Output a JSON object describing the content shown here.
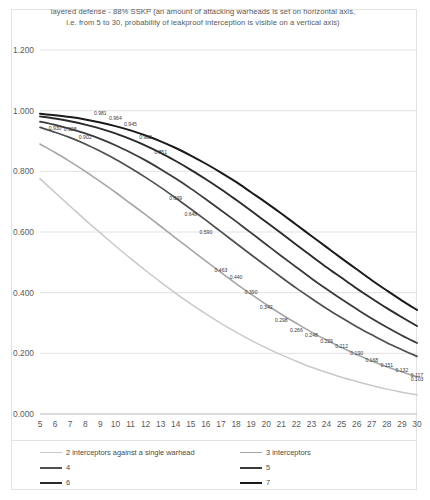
{
  "chart_data": {
    "type": "line",
    "title": "layered defense - 88% SSKP (an amount of attacking warheads is set on horizontal axis, i.e. from 5 to 30, probability of leakproof interception is visible on a vertical axis)",
    "title_line1": "layered defense - 88% SSKP (an amount of attacking warheads is set on horizontal axis,",
    "title_line2": "i.e. from 5 to 30, probability of leakproof interception is visible on a vertical axis)",
    "xlabel": "",
    "ylabel": "",
    "xlim": [
      5,
      30
    ],
    "ylim": [
      0.0,
      1.2
    ],
    "grid": true,
    "legend_position": "bottom",
    "ytick_labels": [
      "1.200",
      "1.000",
      "0.800",
      "0.600",
      "0.400",
      "0.200",
      "0.000"
    ],
    "ytick_values": [
      1.2,
      1.0,
      0.8,
      0.6,
      0.4,
      0.2,
      0.0
    ],
    "x": [
      5,
      6,
      7,
      8,
      9,
      10,
      11,
      12,
      13,
      14,
      15,
      16,
      17,
      18,
      19,
      20,
      21,
      22,
      23,
      24,
      25,
      26,
      27,
      28,
      29,
      30
    ],
    "xtick_labels": [
      "5",
      "6",
      "7",
      "8",
      "9",
      "10",
      "11",
      "12",
      "13",
      "14",
      "15",
      "16",
      "17",
      "18",
      "19",
      "20",
      "21",
      "22",
      "23",
      "24",
      "25",
      "26",
      "27",
      "28",
      "29",
      "30"
    ],
    "series": [
      {
        "name": "2 interceptors against a single warhead",
        "legend_label": "2 interceptors against a single warhead",
        "color": "#c9c9c9",
        "width": 1.5,
        "values": [
          0.776,
          0.73,
          0.685,
          0.64,
          0.597,
          0.554,
          0.513,
          0.473,
          0.435,
          0.398,
          0.363,
          0.33,
          0.299,
          0.27,
          0.243,
          0.218,
          0.195,
          0.174,
          0.154,
          0.137,
          0.121,
          0.107,
          0.094,
          0.082,
          0.072,
          0.063
        ],
        "labels": []
      },
      {
        "name": "3 interceptors",
        "legend_label": "3 interceptors",
        "color": "#a6a6a6",
        "width": 1.6,
        "values": [
          0.89,
          0.862,
          0.832,
          0.8,
          0.766,
          0.731,
          0.694,
          0.657,
          0.619,
          0.58,
          0.542,
          0.504,
          0.467,
          0.43,
          0.395,
          0.361,
          0.329,
          0.299,
          0.27,
          0.244,
          0.219,
          0.196,
          0.175,
          0.156,
          0.139,
          0.123
        ],
        "labels": []
      },
      {
        "name": "4",
        "legend_label": "4",
        "color": "#4f4f4f",
        "width": 1.7,
        "values": [
          0.945,
          0.929,
          0.911,
          0.89,
          0.866,
          0.84,
          0.811,
          0.78,
          0.747,
          0.712,
          0.676,
          0.639,
          0.601,
          0.563,
          0.525,
          0.488,
          0.451,
          0.415,
          0.381,
          0.348,
          0.317,
          0.288,
          0.261,
          0.235,
          0.212,
          0.19
        ],
        "labels": []
      },
      {
        "name": "5",
        "legend_label": "5",
        "color": "#3a3a3a",
        "width": 1.8,
        "values": [
          0.964,
          0.953,
          0.94,
          0.925,
          0.907,
          0.886,
          0.862,
          0.836,
          0.807,
          0.776,
          0.743,
          0.708,
          0.672,
          0.635,
          0.597,
          0.559,
          0.521,
          0.484,
          0.447,
          0.412,
          0.378,
          0.346,
          0.315,
          0.286,
          0.259,
          0.234
        ]
      },
      {
        "name": "6",
        "legend_label": "6",
        "color": "#2b2b2b",
        "width": 1.9,
        "values": [
          0.981,
          0.974,
          0.965,
          0.954,
          0.941,
          0.925,
          0.906,
          0.885,
          0.861,
          0.834,
          0.805,
          0.774,
          0.741,
          0.706,
          0.67,
          0.633,
          0.596,
          0.558,
          0.521,
          0.484,
          0.449,
          0.414,
          0.381,
          0.349,
          0.319,
          0.29
        ]
      },
      {
        "name": "7",
        "legend_label": "7",
        "color": "#1a1a1a",
        "width": 2.0,
        "values": [
          0.99,
          0.985,
          0.979,
          0.971,
          0.961,
          0.949,
          0.935,
          0.918,
          0.899,
          0.877,
          0.852,
          0.825,
          0.796,
          0.765,
          0.731,
          0.697,
          0.661,
          0.624,
          0.587,
          0.55,
          0.513,
          0.477,
          0.441,
          0.407,
          0.374,
          0.343
        ]
      }
    ],
    "point_labels": [
      {
        "x": 6,
        "y": 0.93,
        "text": "0.930"
      },
      {
        "x": 7,
        "y": 0.928,
        "text": "0.928"
      },
      {
        "x": 8,
        "y": 0.902,
        "text": "0.902"
      },
      {
        "x": 9,
        "y": 0.981,
        "text": "0.981"
      },
      {
        "x": 10,
        "y": 0.964,
        "text": "0.964"
      },
      {
        "x": 11,
        "y": 0.945,
        "text": "0.945"
      },
      {
        "x": 12,
        "y": 0.903,
        "text": "0.903"
      },
      {
        "x": 13,
        "y": 0.851,
        "text": "0.851"
      },
      {
        "x": 14,
        "y": 0.699,
        "text": "0.699"
      },
      {
        "x": 15,
        "y": 0.648,
        "text": "0.648"
      },
      {
        "x": 16,
        "y": 0.59,
        "text": "0.590"
      },
      {
        "x": 17,
        "y": 0.463,
        "text": "0.463"
      },
      {
        "x": 18,
        "y": 0.44,
        "text": "0.440"
      },
      {
        "x": 19,
        "y": 0.39,
        "text": "0.390"
      },
      {
        "x": 20,
        "y": 0.342,
        "text": "0.342"
      },
      {
        "x": 21,
        "y": 0.298,
        "text": "0.298"
      },
      {
        "x": 22,
        "y": 0.266,
        "text": "0.266"
      },
      {
        "x": 23,
        "y": 0.248,
        "text": "0.248"
      },
      {
        "x": 24,
        "y": 0.229,
        "text": "0.229"
      },
      {
        "x": 25,
        "y": 0.212,
        "text": "0.212"
      },
      {
        "x": 26,
        "y": 0.19,
        "text": "0.190"
      },
      {
        "x": 27,
        "y": 0.168,
        "text": "0.168"
      },
      {
        "x": 28,
        "y": 0.151,
        "text": "0.151"
      },
      {
        "x": 29,
        "y": 0.132,
        "text": "0.132"
      },
      {
        "x": 30,
        "y": 0.117,
        "text": "0.117"
      },
      {
        "x": 30,
        "y": 0.103,
        "text": "0.103"
      }
    ]
  },
  "legend": {
    "items": [
      {
        "label": "2 interceptors against a single warhead",
        "color": "#c9c9c9",
        "width": 1.6
      },
      {
        "label": "3 interceptors",
        "color": "#a6a6a6",
        "width": 1.8
      },
      {
        "label": "4",
        "color": "#4f4f4f",
        "width": 2.0
      },
      {
        "label": "5",
        "color": "#3a3a3a",
        "width": 2.0
      },
      {
        "label": "6",
        "color": "#2b2b2b",
        "width": 2.2
      },
      {
        "label": "7",
        "color": "#1a1a1a",
        "width": 2.2
      }
    ]
  }
}
